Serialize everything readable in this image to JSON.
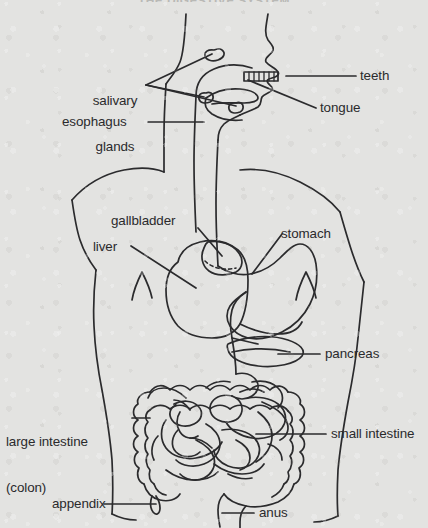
{
  "figure": {
    "title": "THE DIGESTIVE SYSTEM",
    "ink_color": "#2b2b2d",
    "paper_color": "#e3e3e1",
    "text_color": "#2a2a2c"
  },
  "labels": {
    "salivary_glands_line1": "salivary",
    "salivary_glands_line2": "glands",
    "teeth": "teeth",
    "tongue": "tongue",
    "esophagus": "esophagus",
    "gallbladder": "gallbladder",
    "liver": "liver",
    "stomach": "stomach",
    "pancreas": "pancreas",
    "large_intestine_line1": "large intestine",
    "large_intestine_line2": "(colon)",
    "small_intestine": "small intestine",
    "appendix": "appendix",
    "anus": "anus"
  },
  "organs": [
    "salivary glands",
    "teeth",
    "tongue",
    "esophagus",
    "liver",
    "gallbladder",
    "stomach",
    "pancreas",
    "large intestine (colon)",
    "small intestine",
    "appendix",
    "anus"
  ]
}
